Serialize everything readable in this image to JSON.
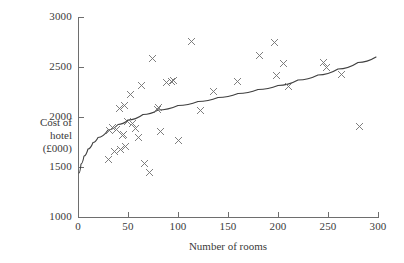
{
  "chart_data": {
    "type": "scatter",
    "title": "",
    "xlabel": "Number of rooms",
    "ylabel": "Cost of hotel (£000)",
    "ylabel_lines": [
      "Cost of",
      "hotel",
      "(£000)"
    ],
    "xlim": [
      0,
      300
    ],
    "ylim": [
      1000,
      3000
    ],
    "xticks": [
      0,
      50,
      100,
      150,
      200,
      250,
      300
    ],
    "yticks": [
      1000,
      1500,
      2000,
      2500,
      3000
    ],
    "xtick_labels": [
      "0",
      "50",
      "100",
      "150",
      "200",
      "250",
      "300"
    ],
    "ytick_labels": [
      "1000",
      "1500",
      "2000",
      "2500",
      "3000"
    ],
    "grid": false,
    "legend": false,
    "marker_style": "x",
    "marker_color": "#707070",
    "curve_color": "#3f3f3f",
    "axis_color": "#6e6e6e",
    "points": [
      {
        "x": 30,
        "y": 1580
      },
      {
        "x": 31,
        "y": 1870
      },
      {
        "x": 34,
        "y": 1900
      },
      {
        "x": 36,
        "y": 1660
      },
      {
        "x": 38,
        "y": 1880
      },
      {
        "x": 41,
        "y": 2090
      },
      {
        "x": 42,
        "y": 1680
      },
      {
        "x": 44,
        "y": 1820
      },
      {
        "x": 45,
        "y": 1825
      },
      {
        "x": 46,
        "y": 2120
      },
      {
        "x": 47,
        "y": 1710
      },
      {
        "x": 49,
        "y": 1960
      },
      {
        "x": 52,
        "y": 2230
      },
      {
        "x": 54,
        "y": 1935
      },
      {
        "x": 57,
        "y": 1890
      },
      {
        "x": 60,
        "y": 1795
      },
      {
        "x": 63,
        "y": 2315
      },
      {
        "x": 66,
        "y": 1535
      },
      {
        "x": 71,
        "y": 1445
      },
      {
        "x": 74,
        "y": 2590
      },
      {
        "x": 79,
        "y": 2075
      },
      {
        "x": 80,
        "y": 2095
      },
      {
        "x": 82,
        "y": 1860
      },
      {
        "x": 88,
        "y": 2345
      },
      {
        "x": 93,
        "y": 2360
      },
      {
        "x": 95,
        "y": 2365
      },
      {
        "x": 100,
        "y": 1770
      },
      {
        "x": 113,
        "y": 2755
      },
      {
        "x": 122,
        "y": 2070
      },
      {
        "x": 135,
        "y": 2260
      },
      {
        "x": 159,
        "y": 2360
      },
      {
        "x": 181,
        "y": 2620
      },
      {
        "x": 196,
        "y": 2750
      },
      {
        "x": 198,
        "y": 2415
      },
      {
        "x": 205,
        "y": 2540
      },
      {
        "x": 210,
        "y": 2305
      },
      {
        "x": 245,
        "y": 2545
      },
      {
        "x": 248,
        "y": 2500
      },
      {
        "x": 263,
        "y": 2430
      },
      {
        "x": 281,
        "y": 1910
      }
    ],
    "fitted_curve": {
      "description": "logarithmic trend line",
      "points": [
        {
          "x": 1,
          "y": 1440
        },
        {
          "x": 3,
          "y": 1530
        },
        {
          "x": 6,
          "y": 1610
        },
        {
          "x": 10,
          "y": 1680
        },
        {
          "x": 15,
          "y": 1745
        },
        {
          "x": 20,
          "y": 1795
        },
        {
          "x": 30,
          "y": 1870
        },
        {
          "x": 40,
          "y": 1925
        },
        {
          "x": 50,
          "y": 1970
        },
        {
          "x": 65,
          "y": 2025
        },
        {
          "x": 80,
          "y": 2070
        },
        {
          "x": 100,
          "y": 2115
        },
        {
          "x": 120,
          "y": 2155
        },
        {
          "x": 140,
          "y": 2195
        },
        {
          "x": 160,
          "y": 2235
        },
        {
          "x": 180,
          "y": 2275
        },
        {
          "x": 200,
          "y": 2315
        },
        {
          "x": 220,
          "y": 2370
        },
        {
          "x": 240,
          "y": 2420
        },
        {
          "x": 260,
          "y": 2480
        },
        {
          "x": 280,
          "y": 2545
        },
        {
          "x": 298,
          "y": 2600
        }
      ]
    }
  }
}
